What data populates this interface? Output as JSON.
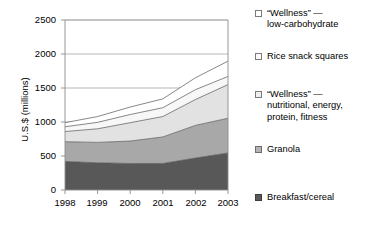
{
  "chart_data": {
    "type": "area",
    "stacked": true,
    "title": "",
    "xlabel": "",
    "ylabel": "U.S.$ (millions)",
    "categories": [
      "1998",
      "1999",
      "2000",
      "2001",
      "2002",
      "2003"
    ],
    "x": [
      1998,
      1999,
      2000,
      2001,
      2002,
      2003
    ],
    "ylim": [
      0,
      2500
    ],
    "yticks": [
      0,
      500,
      1000,
      1500,
      2000,
      2500
    ],
    "ytick_labels": [
      "0",
      "500",
      "1000",
      "1500",
      "2000",
      "2500"
    ],
    "grid": "horizontal",
    "legend_position": "right",
    "series": [
      {
        "name": "Breakfast/cereal",
        "color": "#585858",
        "values": [
          420,
          400,
          390,
          390,
          470,
          545
        ]
      },
      {
        "name": "Granola",
        "color": "#a8a8a8",
        "values": [
          290,
          300,
          330,
          390,
          480,
          510
        ]
      },
      {
        "name": "“Wellness” —\nnutritional, energy,\nprotein, fitness",
        "color": "#e2e2e2",
        "values": [
          150,
          200,
          270,
          300,
          380,
          495
        ]
      },
      {
        "name": "Rice snack squares",
        "color": "#f7f7f7",
        "values": [
          70,
          95,
          120,
          130,
          145,
          120
        ]
      },
      {
        "name": "“Wellness” —\nlow-carbohydrate",
        "color": "#ffffff",
        "values": [
          60,
          85,
          110,
          130,
          175,
          225
        ]
      }
    ],
    "cumulative_tops": [
      [
        420,
        400,
        390,
        390,
        470,
        545
      ],
      [
        710,
        700,
        720,
        780,
        950,
        1055
      ],
      [
        860,
        900,
        990,
        1080,
        1330,
        1550
      ],
      [
        930,
        995,
        1110,
        1210,
        1475,
        1670
      ],
      [
        990,
        1080,
        1220,
        1340,
        1650,
        1895
      ]
    ],
    "axis_color": "#8c8c8c",
    "grid_color": "#9a9a9a",
    "line_color": "#555555"
  },
  "legend": {
    "items": [
      {
        "label": "“Wellness” —\nlow-carbohydrate",
        "swatch_fill": "#ffffff",
        "swatch_border": "#7a7a7a"
      },
      {
        "label": "Rice snack squares",
        "swatch_fill": "#fbfbfb",
        "swatch_border": "#7a7a7a"
      },
      {
        "label": "“Wellness” —\nnutritional, energy,\nprotein, fitness",
        "swatch_fill": "#efefef",
        "swatch_border": "#7a7a7a"
      },
      {
        "label": "Granola",
        "swatch_fill": "#b4b4b4",
        "swatch_border": "#6e6e6e"
      },
      {
        "label": "Breakfast/cereal",
        "swatch_fill": "#5a5a5a",
        "swatch_border": "#3d3d3d"
      }
    ]
  },
  "axes": {
    "y_title": "U.S.$ (millions)",
    "y_tick_labels": [
      "2500",
      "2000",
      "1500",
      "1000",
      "500",
      "0"
    ],
    "x_tick_labels": [
      "1998",
      "1999",
      "2000",
      "2001",
      "2002",
      "2003"
    ]
  }
}
